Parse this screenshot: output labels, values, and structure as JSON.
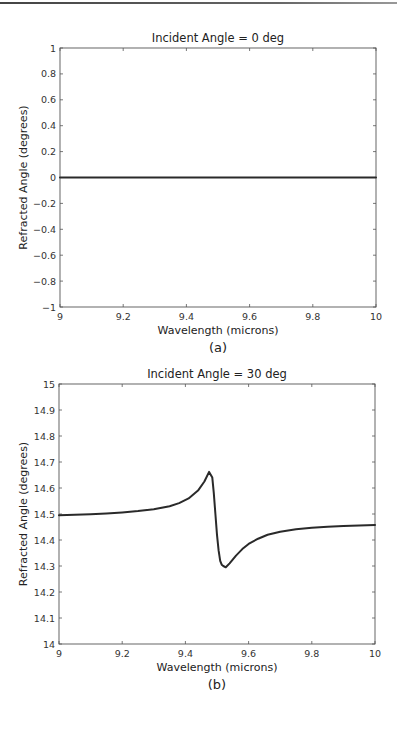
{
  "chart_data": [
    {
      "type": "line",
      "panel": "(a)",
      "title": "Incident Angle = 0 deg",
      "xlabel": "Wavelength (microns)",
      "ylabel": "Refracted Angle (degrees)",
      "xlim": [
        9,
        10
      ],
      "ylim": [
        -1,
        1
      ],
      "xticks": [
        9,
        9.2,
        9.4,
        9.6,
        9.8,
        10
      ],
      "xtick_labels": [
        "9",
        "9.2",
        "9.4",
        "9.6",
        "9.8",
        "10"
      ],
      "yticks": [
        -1,
        -0.8,
        -0.6,
        -0.4,
        -0.2,
        0,
        0.2,
        0.4,
        0.6,
        0.8,
        1
      ],
      "ytick_labels": [
        "−1",
        "−0.8",
        "−0.6",
        "−0.4",
        "−0.2",
        "0",
        "0.2",
        "0.4",
        "0.6",
        "0.8",
        "1"
      ],
      "grid": false,
      "series": [
        {
          "name": "Refracted angle",
          "x": [
            9.0,
            9.2,
            9.4,
            9.6,
            9.8,
            10.0
          ],
          "y": [
            0,
            0,
            0,
            0,
            0,
            0
          ]
        }
      ]
    },
    {
      "type": "line",
      "panel": "(b)",
      "title": "Incident Angle = 30 deg",
      "xlabel": "Wavelength (microns)",
      "ylabel": "Refracted Angle (degrees)",
      "xlim": [
        9,
        10
      ],
      "ylim": [
        14,
        15
      ],
      "xticks": [
        9,
        9.2,
        9.4,
        9.6,
        9.8,
        10
      ],
      "xtick_labels": [
        "9",
        "9.2",
        "9.4",
        "9.6",
        "9.8",
        "10"
      ],
      "yticks": [
        14,
        14.1,
        14.2,
        14.3,
        14.4,
        14.5,
        14.6,
        14.7,
        14.8,
        14.9,
        15
      ],
      "ytick_labels": [
        "14",
        "14.1",
        "14.2",
        "14.3",
        "14.4",
        "14.5",
        "14.6",
        "14.7",
        "14.8",
        "14.9",
        "15"
      ],
      "grid": false,
      "series": [
        {
          "name": "Refracted angle",
          "x": [
            9.0,
            9.05,
            9.1,
            9.15,
            9.2,
            9.25,
            9.3,
            9.35,
            9.38,
            9.41,
            9.44,
            9.46,
            9.475,
            9.485,
            9.49,
            9.495,
            9.5,
            9.505,
            9.51,
            9.515,
            9.52,
            9.528,
            9.54,
            9.56,
            9.58,
            9.6,
            9.63,
            9.66,
            9.7,
            9.75,
            9.8,
            9.85,
            9.9,
            9.95,
            10.0
          ],
          "y": [
            14.495,
            14.497,
            14.499,
            14.502,
            14.506,
            14.511,
            14.518,
            14.53,
            14.542,
            14.56,
            14.59,
            14.625,
            14.662,
            14.64,
            14.58,
            14.5,
            14.42,
            14.36,
            14.32,
            14.305,
            14.3,
            14.295,
            14.31,
            14.34,
            14.365,
            14.385,
            14.405,
            14.42,
            14.432,
            14.441,
            14.447,
            14.451,
            14.454,
            14.456,
            14.458
          ]
        }
      ]
    }
  ]
}
